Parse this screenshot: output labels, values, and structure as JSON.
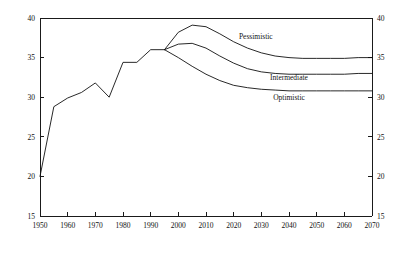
{
  "chart_data": {
    "type": "line",
    "title": "",
    "subtitle": "",
    "xlabel": "",
    "ylabel": "",
    "xlim": [
      1950,
      2070
    ],
    "ylim": [
      15,
      40
    ],
    "grid": false,
    "legend_position": "inline-right",
    "x_ticks": [
      1950,
      1960,
      1970,
      1980,
      1990,
      2000,
      2010,
      2020,
      2030,
      2040,
      2050,
      2060,
      2070
    ],
    "x_tick_labels": [
      "1950",
      "1960",
      "1970",
      "1980",
      "1990",
      "2000",
      "2010",
      "2020",
      "2030",
      "2040",
      "2050",
      "2060",
      "2070"
    ],
    "y_ticks": [
      15,
      20,
      25,
      30,
      35,
      40
    ],
    "y_tick_labels": [
      "15",
      "20",
      "25",
      "30",
      "35",
      "40"
    ],
    "y_ticks_right": [
      15,
      20,
      25,
      30,
      35,
      40
    ],
    "y_tick_labels_right": [
      "15",
      "20",
      "25",
      "30",
      "35",
      "40"
    ],
    "series": [
      {
        "name": "Historical",
        "label": "",
        "x": [
          1950,
          1955,
          1960,
          1965,
          1970,
          1975,
          1980,
          1985,
          1990,
          1995
        ],
        "values": [
          20.0,
          28.8,
          29.9,
          30.6,
          31.8,
          30.0,
          34.4,
          34.4,
          36.0,
          36.0
        ]
      },
      {
        "name": "Pessimistic",
        "label": "Pessimistic",
        "x": [
          1995,
          2000,
          2005,
          2010,
          2015,
          2020,
          2025,
          2030,
          2035,
          2040,
          2045,
          2050,
          2055,
          2060,
          2065,
          2070
        ],
        "values": [
          36.0,
          38.2,
          39.1,
          38.9,
          38.0,
          37.0,
          36.2,
          35.6,
          35.2,
          35.0,
          34.9,
          34.9,
          34.9,
          34.9,
          35.0,
          35.0
        ]
      },
      {
        "name": "Intermediate",
        "label": "Intermediate",
        "x": [
          1995,
          2000,
          2005,
          2010,
          2015,
          2020,
          2025,
          2030,
          2035,
          2040,
          2045,
          2050,
          2055,
          2060,
          2065,
          2070
        ],
        "values": [
          36.0,
          36.7,
          36.8,
          36.2,
          35.2,
          34.3,
          33.6,
          33.2,
          33.0,
          32.9,
          32.9,
          32.9,
          32.9,
          32.9,
          33.0,
          33.0
        ]
      },
      {
        "name": "Optimistic",
        "label": "Optimistic",
        "x": [
          1995,
          2000,
          2005,
          2010,
          2015,
          2020,
          2025,
          2030,
          2035,
          2040,
          2045,
          2050,
          2055,
          2060,
          2065,
          2070
        ],
        "values": [
          36.0,
          35.0,
          33.9,
          32.9,
          32.1,
          31.5,
          31.2,
          31.0,
          30.9,
          30.8,
          30.8,
          30.8,
          30.8,
          30.8,
          30.8,
          30.8
        ]
      }
    ],
    "annotations": [
      {
        "text": "Pessimistic",
        "x": 2028,
        "y": 37.3
      },
      {
        "text": "Intermediate",
        "x": 2040,
        "y": 32.2
      },
      {
        "text": "Optimistic",
        "x": 2040,
        "y": 29.6
      }
    ]
  }
}
